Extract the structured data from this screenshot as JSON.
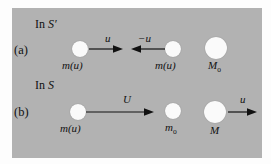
{
  "figure": {
    "background_color": "#b2b2b2",
    "ball_color": "#fafafa",
    "ink_color": "#111111",
    "rows": [
      {
        "row_label": "(a)",
        "frame_label_prefix": "In ",
        "frame_label_symbol": "S′",
        "objects": [
          {
            "name": "left-particle",
            "label": "m(u)",
            "sub": "",
            "size": "small"
          },
          {
            "name": "right-particle",
            "label": "m(u)",
            "sub": "",
            "size": "small"
          },
          {
            "name": "composite-mass",
            "label": "M",
            "sub": "o",
            "size": "large"
          }
        ],
        "vectors": [
          {
            "name": "velocity-u-right",
            "label": "u",
            "direction": "right"
          },
          {
            "name": "velocity-minus-u-left",
            "label": "−u",
            "direction": "left"
          }
        ]
      },
      {
        "row_label": "(b)",
        "frame_label_prefix": "In ",
        "frame_label_symbol": "S",
        "objects": [
          {
            "name": "left-particle",
            "label": "m(u)",
            "sub": "",
            "size": "small"
          },
          {
            "name": "rest-mass-particle",
            "label": "m",
            "sub": "o",
            "size": "small"
          },
          {
            "name": "composite-mass",
            "label": "M",
            "sub": "",
            "size": "large"
          }
        ],
        "vectors": [
          {
            "name": "velocity-U-right",
            "label": "U",
            "direction": "right"
          },
          {
            "name": "velocity-u-right",
            "label": "u",
            "direction": "right"
          }
        ]
      }
    ]
  }
}
